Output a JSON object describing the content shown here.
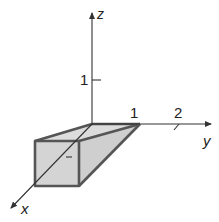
{
  "diagram": {
    "type": "3d-coordinate-axes-with-solid",
    "axes": {
      "z": {
        "label": "z",
        "ticks": [
          {
            "value": "1"
          }
        ]
      },
      "y": {
        "label": "y",
        "ticks": [
          {
            "value": "1"
          },
          {
            "value": "2"
          }
        ]
      },
      "x": {
        "label": "x"
      }
    },
    "solid": {
      "description": "wedge-shaped solid (shaded) along x-axis",
      "fill_color": "#d0d0d0",
      "edge_color": "#555555"
    },
    "colors": {
      "axis": "#333333",
      "background": "#ffffff"
    }
  }
}
